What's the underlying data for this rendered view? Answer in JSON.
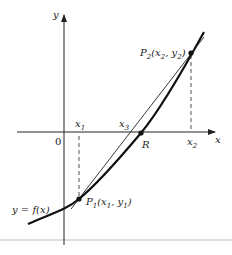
{
  "diagram": {
    "type": "secant-method-illustration",
    "axes": {
      "x_label": "x",
      "y_label": "y",
      "origin_label": "0"
    },
    "curve_label": "y = f(x)",
    "points": {
      "P1": {
        "name": "P",
        "sub": "1",
        "coords": "(x",
        "x_sub": "1",
        "sep": ", y",
        "y_sub": "1",
        "close": ")"
      },
      "P2": {
        "name": "P",
        "sub": "2",
        "coords": "(x",
        "x_sub": "2",
        "sep": ", y",
        "y_sub": "2",
        "close": ")"
      },
      "R": {
        "label": "R"
      }
    },
    "tick_labels": {
      "x1": {
        "base": "x",
        "sub": "1"
      },
      "x2": {
        "base": "x",
        "sub": "2"
      },
      "x3": {
        "base": "x",
        "sub": "3"
      }
    },
    "colors": {
      "ink": "#222222",
      "rule": "#bbbbbb"
    }
  }
}
